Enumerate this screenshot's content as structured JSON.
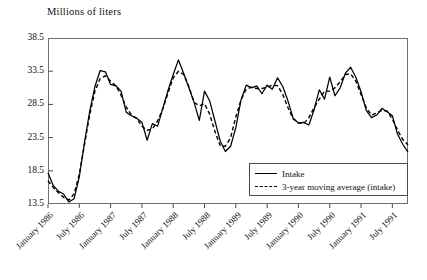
{
  "chart_data": {
    "type": "line",
    "title": "Millions of liters",
    "xlabel": "",
    "ylabel": "Millions of liters",
    "ylim": [
      13.5,
      38.5
    ],
    "yticks": [
      13.5,
      18.5,
      23.5,
      28.5,
      33.5,
      38.5
    ],
    "ytick_labels": [
      "13.5",
      "18.5",
      "23.5",
      "28.5",
      "33.5",
      "38.5"
    ],
    "grid": false,
    "legend_position": "bottom-right inside plot",
    "x_tick_labels": [
      "January 1986",
      "July 1986",
      "January 1987",
      "July 1987",
      "January 1988",
      "July 1988",
      "January 1989",
      "July 1989",
      "January 1990",
      "July 1990",
      "January 1991",
      "July 1991"
    ],
    "x_tick_indices": [
      0,
      6,
      12,
      18,
      24,
      30,
      36,
      42,
      48,
      54,
      60,
      66
    ],
    "x_start": "January 1986",
    "x_end": "July 1991",
    "n_points": 70,
    "series": [
      {
        "name": "Intake",
        "style": "solid",
        "color": "#000000",
        "values": [
          18.2,
          16.3,
          15.4,
          15.0,
          13.8,
          14.3,
          17.6,
          22.8,
          27.5,
          31.2,
          33.6,
          33.4,
          31.5,
          31.3,
          30.5,
          27.3,
          26.8,
          26.4,
          25.8,
          23.1,
          25.6,
          25.2,
          27.9,
          30.6,
          33.0,
          35.2,
          33.2,
          31.0,
          28.8,
          26.1,
          30.5,
          29.0,
          26.0,
          23.0,
          21.4,
          22.2,
          25.0,
          29.2,
          31.4,
          31.0,
          31.3,
          30.1,
          31.4,
          30.8,
          32.5,
          31.2,
          29.0,
          26.4,
          25.7,
          25.8,
          25.4,
          27.7,
          30.7,
          29.3,
          32.6,
          29.8,
          31.0,
          33.2,
          34.1,
          32.6,
          30.4,
          27.6,
          26.5,
          26.9,
          27.9,
          27.4,
          26.8,
          24.0,
          22.5,
          21.3
        ]
      },
      {
        "name": "3-year moving average (intake)",
        "style": "dashed",
        "color": "#000000",
        "values": [
          17.0,
          16.0,
          15.2,
          14.5,
          14.1,
          15.0,
          18.0,
          22.5,
          27.0,
          30.5,
          32.4,
          32.8,
          32.0,
          31.3,
          29.9,
          28.1,
          26.9,
          26.4,
          25.2,
          24.6,
          24.8,
          26.0,
          27.8,
          30.2,
          32.5,
          33.5,
          33.0,
          31.2,
          28.8,
          28.3,
          28.6,
          27.0,
          24.4,
          22.3,
          22.2,
          23.5,
          26.6,
          29.2,
          30.8,
          31.1,
          30.9,
          30.9,
          31.1,
          31.4,
          31.3,
          30.0,
          28.0,
          26.3,
          25.7,
          25.6,
          26.5,
          28.0,
          29.3,
          30.5,
          30.5,
          31.0,
          31.9,
          33.0,
          33.1,
          32.0,
          30.0,
          28.0,
          26.9,
          27.2,
          27.6,
          27.5,
          26.3,
          24.6,
          23.2,
          22.4
        ]
      }
    ],
    "legend": [
      {
        "label": "Intake",
        "style": "solid"
      },
      {
        "label": "3-year moving average (intake)",
        "style": "dashed"
      }
    ]
  }
}
